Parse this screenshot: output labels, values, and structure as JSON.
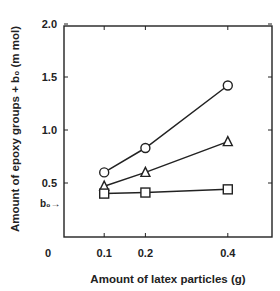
{
  "chart_data": {
    "type": "line",
    "title": "",
    "xlabel": "Amount of latex particles (g)",
    "ylabel": "Amount of epoxy groups + b₀ (m mol)",
    "x": [
      0.1,
      0.2,
      0.4
    ],
    "xticks": [
      "0",
      "0.1",
      "0.2",
      "0.4"
    ],
    "xtick_values": [
      0,
      0.1,
      0.2,
      0.4
    ],
    "yticks": [
      "0.5",
      "1.0",
      "1.5",
      "2.0"
    ],
    "ytick_values": [
      0.5,
      1.0,
      1.5,
      2.0
    ],
    "xlim": [
      0,
      0.5
    ],
    "ylim": [
      0,
      2.0
    ],
    "grid": false,
    "legend": null,
    "annotations": [
      {
        "text": "b₀→",
        "x": 0,
        "y": 0.31,
        "meaning": "baseline b0 marker on y-axis"
      }
    ],
    "series": [
      {
        "name": "circle series",
        "marker": "circle",
        "values": [
          0.6,
          0.83,
          1.42
        ]
      },
      {
        "name": "triangle series",
        "marker": "triangle",
        "values": [
          0.47,
          0.6,
          0.89
        ]
      },
      {
        "name": "square series",
        "marker": "square",
        "values": [
          0.4,
          0.41,
          0.44
        ]
      }
    ]
  },
  "colors": {
    "ink": "#222222",
    "background": "#ffffff"
  }
}
